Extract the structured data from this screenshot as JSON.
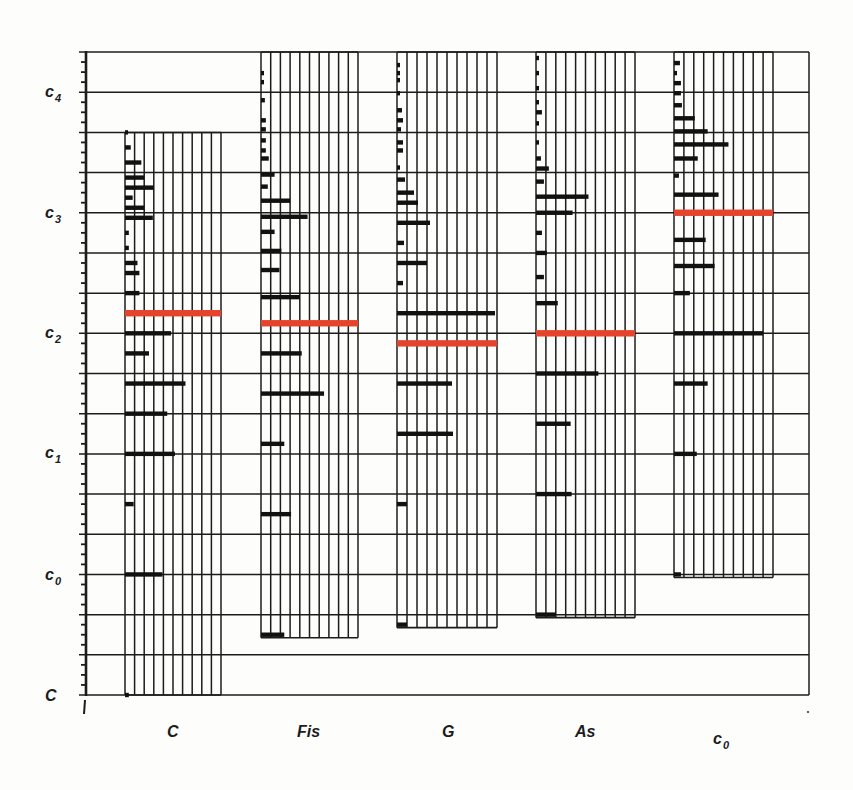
{
  "chart_data": {
    "type": "bar",
    "orientation": "horizontal bars stacked in pitch columns (spectrum diagram)",
    "title": "",
    "xlabel": "",
    "ylabel": "",
    "y_unit": "semitones above C",
    "ylim": [
      0,
      64
    ],
    "grid": true,
    "grid_step": 4,
    "minor_tick_step": 1,
    "legend": null,
    "amplitude_unit": "grid sub-columns (full column = 10)",
    "y_ticks": [
      {
        "label": "C",
        "base": "C",
        "sub": "",
        "semitone": 0
      },
      {
        "label": "c0",
        "base": "c",
        "sub": "0",
        "semitone": 12
      },
      {
        "label": "c1",
        "base": "c",
        "sub": "1",
        "semitone": 24
      },
      {
        "label": "c2",
        "base": "c",
        "sub": "2",
        "semitone": 36
      },
      {
        "label": "c3",
        "base": "c",
        "sub": "3",
        "semitone": 48
      },
      {
        "label": "c4",
        "base": "c",
        "sub": "4",
        "semitone": 60
      }
    ],
    "categories": [
      "C",
      "Fis",
      "G",
      "As",
      "c0"
    ],
    "x_labels": [
      {
        "base": "C",
        "sub": ""
      },
      {
        "base": "Fis",
        "sub": ""
      },
      {
        "base": "G",
        "sub": ""
      },
      {
        "base": "As",
        "sub": ""
      },
      {
        "base": "c",
        "sub": "0"
      }
    ],
    "colors": {
      "grid": "#1c1c1c",
      "partial": "#111111",
      "highlight": "#e5432b"
    },
    "series": [
      {
        "name": "C",
        "fundamental": 0,
        "top": 56,
        "highlight_semitone": 38,
        "partials": [
          [
            0,
            0.4
          ],
          [
            12,
            3.9
          ],
          [
            19,
            0.9
          ],
          [
            24,
            5.2
          ],
          [
            28,
            4.4
          ],
          [
            31,
            6.3
          ],
          [
            34,
            2.5
          ],
          [
            36,
            4.8
          ],
          [
            40,
            1.5
          ],
          [
            42,
            1.5
          ],
          [
            43,
            1.3
          ],
          [
            44.5,
            0.4
          ],
          [
            46,
            0.4
          ],
          [
            47.5,
            2.9
          ],
          [
            48.5,
            2.0
          ],
          [
            49.5,
            0.8
          ],
          [
            50.5,
            3.0
          ],
          [
            51.5,
            2.0
          ],
          [
            53,
            1.7
          ],
          [
            54.5,
            0.6
          ],
          [
            56,
            0.3
          ]
        ]
      },
      {
        "name": "Fis",
        "fundamental": 6,
        "top": 64,
        "highlight_semitone": 37,
        "partials": [
          [
            6,
            2.4
          ],
          [
            18,
            3.1
          ],
          [
            25,
            2.4
          ],
          [
            30,
            6.5
          ],
          [
            34,
            4.2
          ],
          [
            39.6,
            4.0
          ],
          [
            42.3,
            1.9
          ],
          [
            44.2,
            2.1
          ],
          [
            46.1,
            1.4
          ],
          [
            47.6,
            4.8
          ],
          [
            49.2,
            3.0
          ],
          [
            50.6,
            0.7
          ],
          [
            51.8,
            1.4
          ],
          [
            53.4,
            0.8
          ],
          [
            54.2,
            0.5
          ],
          [
            55.2,
            0.5
          ],
          [
            56.3,
            0.5
          ],
          [
            57.2,
            0.5
          ],
          [
            59.2,
            0.4
          ],
          [
            61,
            0.3
          ],
          [
            61.9,
            0.3
          ]
        ]
      },
      {
        "name": "G",
        "fundamental": 7,
        "top": 64,
        "highlight_semitone": 35,
        "partials": [
          [
            7,
            1.0
          ],
          [
            19,
            1.0
          ],
          [
            26,
            5.6
          ],
          [
            31,
            5.5
          ],
          [
            38,
            9.8
          ],
          [
            41,
            0.6
          ],
          [
            43,
            3.0
          ],
          [
            45,
            0.7
          ],
          [
            47,
            3.3
          ],
          [
            49,
            2.1
          ],
          [
            50,
            1.7
          ],
          [
            51.3,
            0.8
          ],
          [
            52.5,
            0.3
          ],
          [
            54.2,
            0.6
          ],
          [
            55,
            0.6
          ],
          [
            56.3,
            0.4
          ],
          [
            57.2,
            0.6
          ],
          [
            58.2,
            0.5
          ],
          [
            59.9,
            0.3
          ],
          [
            61.2,
            0.3
          ],
          [
            61.9,
            0.3
          ],
          [
            62.7,
            0.3
          ]
        ]
      },
      {
        "name": "As",
        "fundamental": 8,
        "top": 64,
        "highlight_semitone": 36,
        "partials": [
          [
            8,
            2.0
          ],
          [
            20,
            3.6
          ],
          [
            27,
            3.5
          ],
          [
            32,
            6.3
          ],
          [
            39,
            2.2
          ],
          [
            41.6,
            0.8
          ],
          [
            44,
            1.1
          ],
          [
            46,
            0.6
          ],
          [
            48,
            3.7
          ],
          [
            49.6,
            5.3
          ],
          [
            51.1,
            0.8
          ],
          [
            52.4,
            1.3
          ],
          [
            53.4,
            0.5
          ],
          [
            55,
            0.3
          ],
          [
            56.9,
            0.3
          ],
          [
            58,
            0.6
          ],
          [
            59,
            0.3
          ],
          [
            60.4,
            0.3
          ],
          [
            61.9,
            0.3
          ],
          [
            63.4,
            0.3
          ]
        ]
      },
      {
        "name": "c0",
        "fundamental": 12,
        "top": 64,
        "highlight_semitone": 48,
        "partials": [
          [
            12,
            0.7
          ],
          [
            24,
            2.3
          ],
          [
            31,
            3.4
          ],
          [
            36,
            9.0
          ],
          [
            40,
            1.6
          ],
          [
            42.7,
            4.1
          ],
          [
            45.3,
            3.2
          ],
          [
            49.8,
            4.5
          ],
          [
            51.7,
            0.5
          ],
          [
            53.4,
            2.4
          ],
          [
            54.8,
            5.5
          ],
          [
            56.1,
            3.4
          ],
          [
            57.4,
            2.1
          ],
          [
            58.7,
            0.8
          ],
          [
            59.9,
            0.7
          ],
          [
            60.9,
            0.7
          ],
          [
            61.9,
            0.3
          ],
          [
            62.9,
            0.6
          ]
        ]
      }
    ]
  }
}
